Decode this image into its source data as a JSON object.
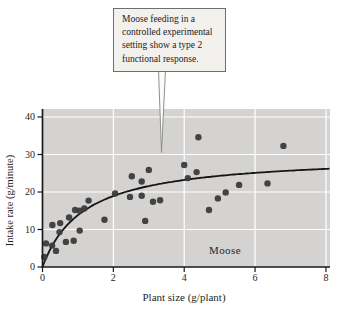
{
  "chart_data": {
    "type": "scatter",
    "xlabel": "Plant size (g/plant)",
    "ylabel": "Intake rate (g/minute)",
    "inplot_label": "Moose",
    "xlim": [
      0,
      8.12
    ],
    "ylim": [
      0,
      42
    ],
    "xticks": [
      0,
      2,
      4,
      6,
      8
    ],
    "yticks": [
      0,
      10,
      20,
      30,
      40
    ],
    "grid": true,
    "series": [
      {
        "name": "Moose intake observations",
        "type": "scatter",
        "points": [
          [
            0.05,
            2.7
          ],
          [
            0.1,
            6.3
          ],
          [
            0.27,
            5.7
          ],
          [
            0.38,
            4.3
          ],
          [
            0.28,
            11.2
          ],
          [
            0.5,
            11.7
          ],
          [
            0.48,
            9.3
          ],
          [
            0.66,
            6.7
          ],
          [
            0.75,
            13.2
          ],
          [
            0.88,
            7.0
          ],
          [
            0.92,
            15.2
          ],
          [
            1.05,
            15.0
          ],
          [
            1.05,
            9.7
          ],
          [
            1.18,
            15.6
          ],
          [
            1.3,
            17.7
          ],
          [
            1.75,
            12.6
          ],
          [
            2.05,
            19.6
          ],
          [
            2.47,
            18.7
          ],
          [
            2.52,
            24.2
          ],
          [
            2.8,
            22.8
          ],
          [
            2.8,
            19.0
          ],
          [
            2.9,
            12.3
          ],
          [
            3.0,
            25.9
          ],
          [
            3.12,
            17.4
          ],
          [
            3.32,
            17.8
          ],
          [
            4.0,
            27.2
          ],
          [
            4.1,
            23.7
          ],
          [
            4.35,
            25.3
          ],
          [
            4.4,
            34.6
          ],
          [
            4.7,
            15.2
          ],
          [
            4.95,
            18.3
          ],
          [
            5.17,
            19.9
          ],
          [
            5.55,
            21.9
          ],
          [
            6.35,
            22.3
          ],
          [
            6.8,
            32.3
          ]
        ]
      }
    ],
    "curve": {
      "name": "Type 2 functional response fit",
      "equation": "y = a*x/(b+x)",
      "a": 30,
      "b": 1.17,
      "x_range": [
        0,
        8.12
      ]
    }
  },
  "annotation": {
    "lines": [
      "Moose feeding in a",
      "controlled experimental",
      "setting show a type 2",
      "functional response."
    ]
  },
  "colors": {
    "plot_bg": "#d4d3d1",
    "grid": "#ffffff",
    "point": "#3b3b3b",
    "curve": "#161616",
    "axis": "#1a1a1a",
    "text": "#1f1f1f",
    "callout_bg": "#f2f1ee",
    "callout_border": "#6e6e6e",
    "leader": "#8f8f8f"
  }
}
